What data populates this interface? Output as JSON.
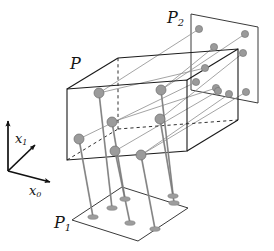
{
  "figure": {
    "background": "#ffffff",
    "width": 274,
    "height": 251
  },
  "labels": {
    "box": "P",
    "plane_bottom_base": "P",
    "plane_bottom_sub": "1",
    "plane_right_base": "P",
    "plane_right_sub": "2",
    "axis_x0_base": "x",
    "axis_x0_sub": "0",
    "axis_x1_base": "x",
    "axis_x1_sub": "1"
  },
  "colors": {
    "line": "#1a1a1a",
    "thin_line": "#6e6e6e",
    "dot_fill": "#9a9a9a",
    "dot_stroke": "#6b6b6b",
    "shadow_fill": "#a8a8a8",
    "stem": "#8c8c8c",
    "dashed": "#1a1a1a"
  },
  "geometry": {
    "axes": {
      "origin": [
        8,
        171
      ],
      "x0_tip": [
        53,
        183
      ],
      "x1_tip": [
        37,
        143
      ],
      "x2_tip": [
        8,
        119
      ]
    },
    "box_P": {
      "front_top_left": [
        67,
        89
      ],
      "front_bottom_left": [
        67,
        160
      ],
      "front_top_right": [
        187,
        80
      ],
      "front_bottom_right": [
        187,
        151
      ],
      "back_top_left": [
        118,
        58
      ],
      "back_bottom_left": [
        118,
        129
      ],
      "back_top_right": [
        238,
        49
      ],
      "back_bottom_right": [
        238,
        120
      ]
    },
    "plane_P1": {
      "corners": [
        [
          72,
          220
        ],
        [
          122,
          187
        ],
        [
          188,
          208
        ],
        [
          138,
          241
        ]
      ]
    },
    "plane_P2": {
      "corners": [
        [
          191,
          14
        ],
        [
          258,
          27
        ],
        [
          258,
          103
        ],
        [
          191,
          90
        ]
      ]
    }
  },
  "points": {
    "count": 7,
    "radius_3d": 5.0,
    "radius_proj": 4.0,
    "items": [
      {
        "id": "p1",
        "box": [
          99,
          93
        ],
        "p1": [
          112,
          208
        ],
        "p2": [
          205,
          68
        ]
      },
      {
        "id": "p2",
        "box": [
          112,
          122
        ],
        "p1": [
          125,
          199
        ],
        "p2": [
          216,
          88
        ]
      },
      {
        "id": "p3",
        "box": [
          79,
          139
        ],
        "p1": [
          93,
          217
        ],
        "p2": [
          196,
          82
        ]
      },
      {
        "id": "p4",
        "box": [
          115,
          151
        ],
        "p1": [
          130,
          223
        ],
        "p2": [
          218,
          91
        ]
      },
      {
        "id": "p5",
        "box": [
          141,
          155
        ],
        "p1": [
          155,
          229
        ],
        "p2": [
          229,
          94
        ]
      },
      {
        "id": "p6",
        "box": [
          161,
          90
        ],
        "p1": [
          174,
          203
        ],
        "p2": [
          245,
          34
        ]
      },
      {
        "id": "p7",
        "box": [
          160,
          119
        ],
        "p1": [
          173,
          196
        ],
        "p2": [
          243,
          53
        ]
      }
    ],
    "extra_p2_dots": [
      [
        199,
        29
      ],
      [
        214,
        47
      ],
      [
        246,
        92
      ]
    ]
  }
}
